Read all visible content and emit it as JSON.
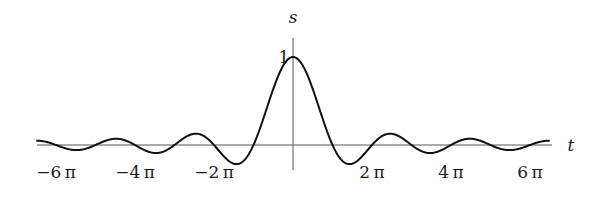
{
  "chart_data": {
    "type": "line",
    "title": "",
    "function": "s = sin(t)/t",
    "xlabel": "t",
    "ylabel": "s",
    "x_ticks": [
      {
        "value_pi": -6,
        "label": "−6 π"
      },
      {
        "value_pi": -4,
        "label": "−4 π"
      },
      {
        "value_pi": -2,
        "label": "−2 π"
      },
      {
        "value_pi": 2,
        "label": "2 π"
      },
      {
        "value_pi": 4,
        "label": "4 π"
      },
      {
        "value_pi": 6,
        "label": "6 π"
      }
    ],
    "y_ticks": [
      {
        "value": 1,
        "label": "1"
      }
    ],
    "xlim_pi": [
      -6.5,
      6.5
    ],
    "ylim": [
      -0.3,
      1.1
    ],
    "grid": false,
    "legend": null,
    "series": [
      {
        "name": "sinc",
        "x_pi": [
          -6.5,
          -6,
          -5.5,
          -5,
          -4.5,
          -4,
          -3.5,
          -3,
          -2.5,
          -2,
          -1.43,
          -1,
          -0.5,
          0,
          0.5,
          1,
          1.43,
          2,
          2.5,
          3,
          3.5,
          4,
          4.5,
          5,
          5.5,
          6,
          6.5
        ],
        "values": [
          0.049,
          0,
          -0.058,
          0,
          0.071,
          0,
          -0.091,
          0,
          0.127,
          0,
          -0.217,
          0,
          0.637,
          1,
          0.637,
          0,
          -0.217,
          0,
          0.127,
          0,
          -0.091,
          0,
          0.071,
          0,
          -0.058,
          0,
          0.049
        ]
      }
    ]
  },
  "axes": {
    "x_label": "t",
    "y_label": "s",
    "y_tick_label": "1"
  }
}
